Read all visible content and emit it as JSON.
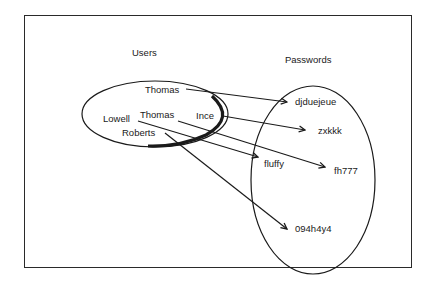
{
  "diagram": {
    "users_set": {
      "title": "Users",
      "items": [
        {
          "label": "Thomas"
        },
        {
          "label": "Lowell"
        },
        {
          "label": "Thomas"
        },
        {
          "label": "Ince"
        },
        {
          "label": "Roberts"
        }
      ]
    },
    "passwords_set": {
      "title": "Passwords",
      "items": [
        {
          "label": "djduejeue"
        },
        {
          "label": "zxkkk"
        },
        {
          "label": "fluffy"
        },
        {
          "label": "fh777"
        },
        {
          "label": "094h4y4"
        }
      ]
    },
    "mappings": [
      {
        "from": "Thomas",
        "to": "djduejeue"
      },
      {
        "from": "Ince",
        "to": "zxkkk"
      },
      {
        "from": "Thomas",
        "to": "fh777"
      },
      {
        "from": "Lowell",
        "to": "fluffy"
      },
      {
        "from": "Roberts",
        "to": "094h4y4"
      }
    ],
    "colors": {
      "ink": "#1a1a1a",
      "background": "#ffffff"
    }
  }
}
